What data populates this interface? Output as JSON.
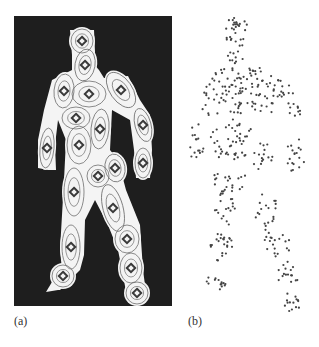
{
  "figure": {
    "panels": [
      {
        "id": "a",
        "label": "(a)",
        "description": "Binary human silhouette (white on black) overlaid with Gaussian blob ellipses and diamond-shaped blob centers",
        "background_color": "#1e1e1e",
        "silhouette_color": "#f4f4f4",
        "ellipse_color": "#6e6e6e",
        "marker_color": "#3a3a3a",
        "frame": {
          "x": 14,
          "y": 16,
          "width": 158,
          "height": 290
        },
        "blobs": [
          {
            "part": "head",
            "cx": 82,
            "cy": 41,
            "rx": 11,
            "ry": 12,
            "rot": 0
          },
          {
            "part": "neck",
            "cx": 85,
            "cy": 65,
            "rx": 10,
            "ry": 16,
            "rot": 10
          },
          {
            "part": "left-shoulder",
            "cx": 64,
            "cy": 91,
            "rx": 10,
            "ry": 17,
            "rot": 5
          },
          {
            "part": "chest",
            "cx": 89,
            "cy": 94,
            "rx": 17,
            "ry": 13,
            "rot": 0
          },
          {
            "part": "right-shoulder",
            "cx": 121,
            "cy": 90,
            "rx": 11,
            "ry": 20,
            "rot": -35
          },
          {
            "part": "waist",
            "cx": 76,
            "cy": 118,
            "rx": 14,
            "ry": 11,
            "rot": 0
          },
          {
            "part": "right-hip",
            "cx": 100,
            "cy": 129,
            "rx": 9,
            "ry": 20,
            "rot": 5
          },
          {
            "part": "right-forearm",
            "cx": 143,
            "cy": 125,
            "rx": 8,
            "ry": 17,
            "rot": -15
          },
          {
            "part": "left-forearm",
            "cx": 47,
            "cy": 148,
            "rx": 7,
            "ry": 20,
            "rot": 5
          },
          {
            "part": "pelvis",
            "cx": 79,
            "cy": 145,
            "rx": 12,
            "ry": 19,
            "rot": 0
          },
          {
            "part": "right-hand",
            "cx": 143,
            "cy": 163,
            "rx": 8,
            "ry": 15,
            "rot": 0
          },
          {
            "part": "right-thigh-top",
            "cx": 115,
            "cy": 168,
            "rx": 10,
            "ry": 14,
            "rot": -10
          },
          {
            "part": "crotch",
            "cx": 98,
            "cy": 176,
            "rx": 11,
            "ry": 11,
            "rot": 0
          },
          {
            "part": "left-thigh",
            "cx": 74,
            "cy": 192,
            "rx": 10,
            "ry": 24,
            "rot": 0
          },
          {
            "part": "right-upper-leg",
            "cx": 113,
            "cy": 208,
            "rx": 10,
            "ry": 24,
            "rot": -15
          },
          {
            "part": "right-knee",
            "cx": 127,
            "cy": 239,
            "rx": 12,
            "ry": 14,
            "rot": 0
          },
          {
            "part": "left-knee",
            "cx": 71,
            "cy": 247,
            "rx": 9,
            "ry": 22,
            "rot": 0
          },
          {
            "part": "right-shin",
            "cx": 131,
            "cy": 268,
            "rx": 11,
            "ry": 15,
            "rot": 0
          },
          {
            "part": "left-foot",
            "cx": 63,
            "cy": 276,
            "rx": 11,
            "ry": 11,
            "rot": 0
          },
          {
            "part": "right-foot",
            "cx": 137,
            "cy": 293,
            "rx": 11,
            "ry": 11,
            "rot": 0
          }
        ]
      },
      {
        "id": "b",
        "label": "(b)",
        "description": "Scatter of sampled foreground points forming the same human silhouette",
        "dot_color": "#444444",
        "dot_radius": 1.1
      }
    ]
  }
}
